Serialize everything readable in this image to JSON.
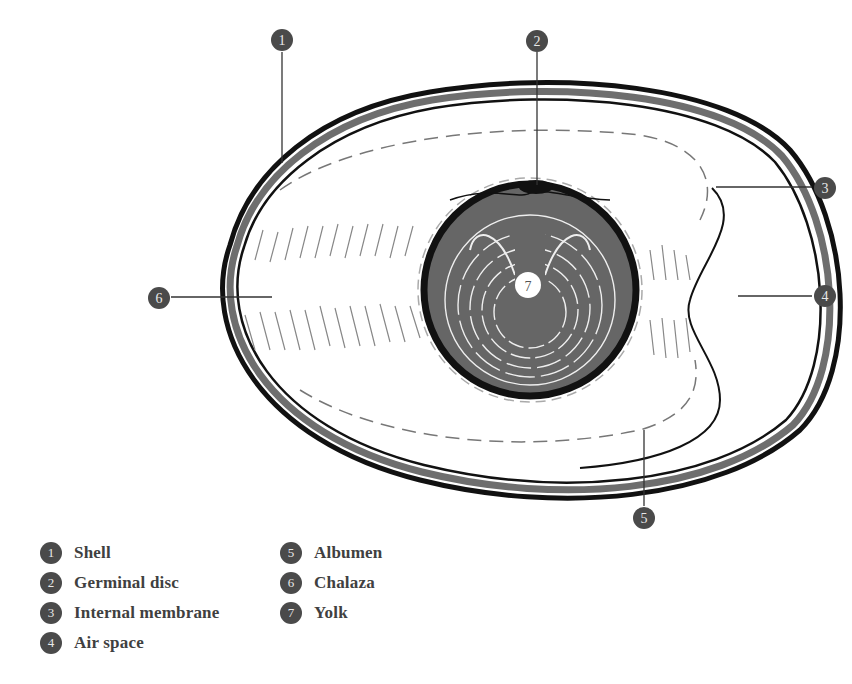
{
  "callouts": [
    {
      "num": "1",
      "label": "Shell"
    },
    {
      "num": "2",
      "label": "Germinal disc"
    },
    {
      "num": "3",
      "label": "Internal membrane"
    },
    {
      "num": "4",
      "label": "Air space"
    },
    {
      "num": "5",
      "label": "Albumen"
    },
    {
      "num": "6",
      "label": "Chalaza"
    },
    {
      "num": "7",
      "label": "Yolk"
    }
  ],
  "colors": {
    "badge": "#4a4a4a",
    "shell_band": "#6e6e6e",
    "yolk": "#6a6a6a",
    "outline": "#111111",
    "label_text": "#404040"
  }
}
